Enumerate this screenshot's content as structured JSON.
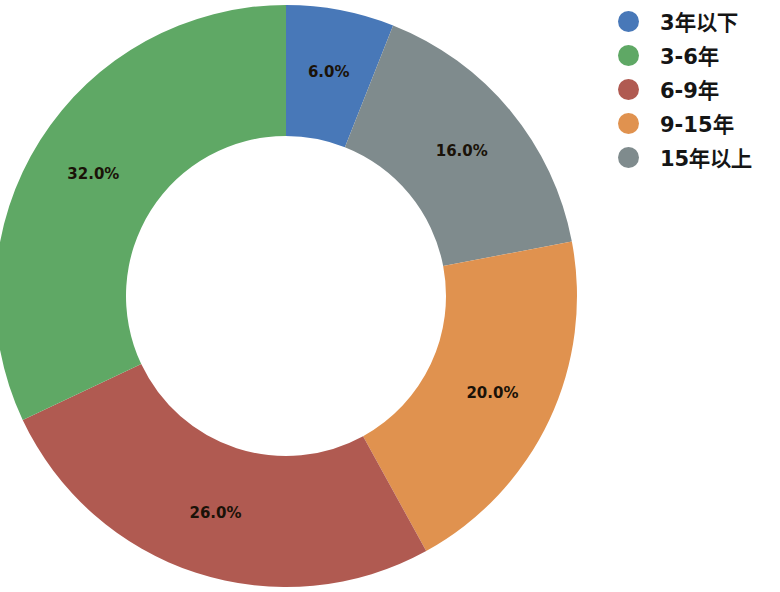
{
  "chart_data": {
    "type": "pie",
    "variant": "donut",
    "title": "",
    "subtitle": "",
    "xlabel": "",
    "ylabel": "",
    "categories": [
      "3年以下",
      "3-6年",
      "6-9年",
      "9-15年",
      "15年以上"
    ],
    "values": [
      6.0,
      32.0,
      26.0,
      20.0,
      16.0
    ],
    "value_unit": "%",
    "data_labels": [
      "6.0%",
      "32.0%",
      "26.0%",
      "20.0%",
      "16.0%"
    ],
    "colors": [
      "#4878b8",
      "#5fa865",
      "#b05a51",
      "#e0924f",
      "#7f8b8d"
    ],
    "start_angle_deg": 90,
    "direction": "clockwise",
    "hole_ratio": 0.55,
    "grid": false,
    "legend": {
      "position": "right",
      "entries": [
        {
          "label": "3年以下",
          "color": "#4878b8",
          "value": 6.0,
          "marker": "circle"
        },
        {
          "label": "3-6年",
          "color": "#5fa865",
          "value": 32.0,
          "marker": "circle"
        },
        {
          "label": "6-9年",
          "color": "#b05a51",
          "value": 26.0,
          "marker": "circle"
        },
        {
          "label": "9-15年",
          "color": "#e0924f",
          "value": 20.0,
          "marker": "circle"
        },
        {
          "label": "15年以上",
          "color": "#7f8b8d",
          "value": 16.0,
          "marker": "circle"
        }
      ]
    },
    "slices_clockwise_from_top": [
      {
        "label": "3年以下",
        "data_label": "6.0%",
        "color": "#4878b8",
        "value": 6.0
      },
      {
        "label": "15年以上",
        "data_label": "16.0%",
        "color": "#7f8b8d",
        "value": 16.0
      },
      {
        "label": "9-15年",
        "data_label": "20.0%",
        "color": "#e0924f",
        "value": 20.0
      },
      {
        "label": "6-9年",
        "data_label": "26.0%",
        "color": "#b05a51",
        "value": 26.0
      },
      {
        "label": "3-6年",
        "data_label": "32.0%",
        "color": "#5fa865",
        "value": 32.0
      }
    ]
  },
  "labels": {
    "blue": "6.0%",
    "gray": "16.0%",
    "orange": "20.0%",
    "red": "26.0%",
    "green": "32.0%"
  },
  "legend": {
    "items": [
      {
        "label": "3年以下"
      },
      {
        "label": "3-6年"
      },
      {
        "label": "6-9年"
      },
      {
        "label": "9-15年"
      },
      {
        "label": "15年以上"
      }
    ]
  }
}
